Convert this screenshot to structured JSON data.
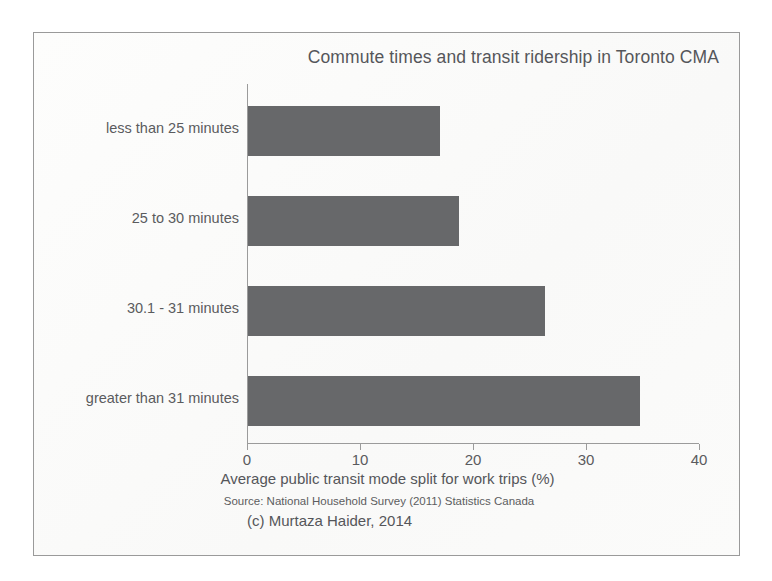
{
  "chart_data": {
    "type": "bar",
    "orientation": "horizontal",
    "title": "Commute times and transit ridership in Toronto CMA",
    "xlabel": "Average public transit mode split for work trips (%)",
    "ylabel": "",
    "categories": [
      "less than 25 minutes",
      "25 to 30 minutes",
      "30.1 - 31 minutes",
      "greater than 31 minutes"
    ],
    "values": [
      17.0,
      18.7,
      26.3,
      34.7
    ],
    "xlim": [
      0,
      40
    ],
    "xticks": [
      0,
      10,
      20,
      30,
      40
    ],
    "xtick_labels": [
      "0",
      "10",
      "20",
      "30",
      "40"
    ],
    "grid": false,
    "legend": false,
    "bar_color": "#67686a",
    "axis_color": "#9b9b9b",
    "text_color": "#55565a"
  },
  "footnotes": {
    "source": "Source: National Household Survey (2011) Statistics Canada",
    "copyright": "(c) Murtaza Haider, 2014"
  }
}
